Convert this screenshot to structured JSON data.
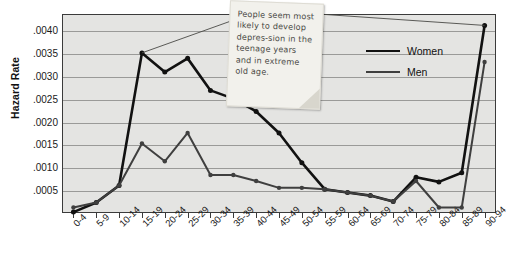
{
  "chart_data": {
    "type": "line",
    "title": "",
    "xlabel": "",
    "ylabel": "Hazard Rate",
    "categories": [
      "0-4",
      "5-9",
      "10-14",
      "15-19",
      "20-24",
      "25-29",
      "30-34",
      "35-39",
      "40-44",
      "45-49",
      "50-54",
      "55-59",
      "60-64",
      "65-69",
      "70-74",
      "75-79",
      "80-84",
      "85-89",
      "90-94"
    ],
    "ylim": [
      0,
      0.00435
    ],
    "ytick_values": [
      0.0005,
      0.001,
      0.0015,
      0.002,
      0.0025,
      0.003,
      0.0035,
      0.004
    ],
    "ytick_labels": [
      ".0005",
      ".0010",
      ".0015",
      ".0020",
      ".0025",
      ".0030",
      ".0035",
      ".0040"
    ],
    "grid": true,
    "legend_position": "inside-right",
    "series": [
      {
        "name": "Women",
        "color": "#111111",
        "values": [
          2e-05,
          0.00023,
          0.0006,
          0.0035,
          0.00308,
          0.00338,
          0.00268,
          0.0025,
          0.00222,
          0.00175,
          0.0011,
          0.00052,
          0.00045,
          0.00038,
          0.00025,
          0.00078,
          0.00068,
          0.00088,
          0.0041
        ]
      },
      {
        "name": "Men",
        "color": "#3f3f3f",
        "values": [
          0.00012,
          0.00023,
          0.0006,
          0.00152,
          0.00113,
          0.00175,
          0.00083,
          0.00083,
          0.0007,
          0.00055,
          0.00055,
          0.00052,
          0.00045,
          0.00038,
          0.00025,
          0.0007,
          0.00012,
          0.00012,
          0.0033
        ]
      }
    ],
    "annotation": {
      "text": "People seem most likely to develop depres-sion in the teenage years and in extreme old age.",
      "points_to": [
        "15-19",
        "90-94"
      ]
    }
  },
  "legend": {
    "items": [
      {
        "label": "Women"
      },
      {
        "label": "Men"
      }
    ]
  }
}
